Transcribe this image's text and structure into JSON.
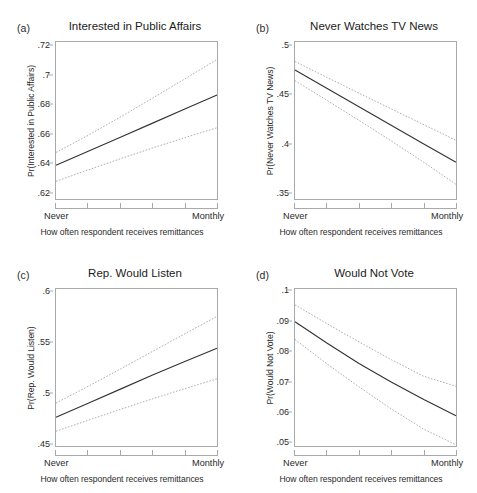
{
  "figure": {
    "xaxis_title": "How often respondent receives remittances",
    "xtick_left": "Never",
    "xtick_right": "Monthly",
    "n_xticks": 6,
    "fit_color": "#333333",
    "ci_color": "#9d9d9d",
    "frame_color": "#a9a9a9"
  },
  "panels": [
    {
      "tag": "(a)",
      "title": "Interested in Public Affairs",
      "ylabel": "Pr(Interested in Public Affairs)",
      "yticks": [
        ".62",
        ".64",
        ".66",
        ".68",
        ".7",
        ".72"
      ],
      "ytick_values": [
        0.62,
        0.64,
        0.66,
        0.68,
        0.7,
        0.72
      ],
      "ylim": [
        0.615,
        0.723
      ],
      "xlim": [
        0,
        1
      ]
    },
    {
      "tag": "(b)",
      "title": "Never Watches TV News",
      "ylabel": "Pr(Never Watches TV News)",
      "yticks": [
        ".35",
        ".4",
        ".45",
        ".5"
      ],
      "ytick_values": [
        0.35,
        0.4,
        0.45,
        0.5
      ],
      "ylim": [
        0.343,
        0.504
      ],
      "xlim": [
        0,
        1
      ]
    },
    {
      "tag": "(c)",
      "title": "Rep. Would Listen",
      "ylabel": "Pr(Rep. Would Listen)",
      "yticks": [
        ".45",
        ".5",
        ".55",
        ".6"
      ],
      "ytick_values": [
        0.45,
        0.5,
        0.55,
        0.6
      ],
      "ylim": [
        0.447,
        0.603
      ],
      "xlim": [
        0,
        1
      ]
    },
    {
      "tag": "(d)",
      "title": "Would Not Vote",
      "ylabel": "Pr(Would Not Vote)",
      "yticks": [
        ".05",
        ".06",
        ".07",
        ".08",
        ".09",
        ".1"
      ],
      "ytick_values": [
        0.05,
        0.06,
        0.07,
        0.08,
        0.09,
        0.1
      ],
      "ylim": [
        0.0485,
        0.1008
      ],
      "xlim": [
        0,
        1
      ]
    }
  ],
  "chart_data": [
    {
      "type": "line",
      "panel": "(a)",
      "title": "Interested in Public Affairs",
      "xlabel": "How often respondent receives remittances",
      "ylabel": "Pr(Interested in Public Affairs)",
      "xtick_labels": [
        "Never",
        "",
        "",
        "",
        "",
        "Monthly"
      ],
      "x": [
        0,
        0.2,
        0.4,
        0.6,
        0.8,
        1
      ],
      "ylim": [
        0.615,
        0.723
      ],
      "grid": false,
      "legend": "none",
      "series": [
        {
          "name": "Predicted probability",
          "style": "solid",
          "values": [
            0.6382,
            0.6478,
            0.6575,
            0.6672,
            0.6769,
            0.6866
          ]
        },
        {
          "name": "95% CI upper",
          "style": "dotted",
          "values": [
            0.647,
            0.6588,
            0.6714,
            0.6844,
            0.6976,
            0.711
          ]
        },
        {
          "name": "95% CI lower",
          "style": "dotted",
          "values": [
            0.6272,
            0.635,
            0.6427,
            0.6501,
            0.6572,
            0.664
          ]
        }
      ]
    },
    {
      "type": "line",
      "panel": "(b)",
      "title": "Never Watches TV News",
      "xlabel": "How often respondent receives remittances",
      "ylabel": "Pr(Never Watches TV News)",
      "xtick_labels": [
        "Never",
        "",
        "",
        "",
        "",
        "Monthly"
      ],
      "x": [
        0,
        0.2,
        0.4,
        0.6,
        0.8,
        1
      ],
      "ylim": [
        0.343,
        0.504
      ],
      "grid": false,
      "legend": "none",
      "series": [
        {
          "name": "Predicted probability",
          "style": "solid",
          "values": [
            0.4752,
            0.4562,
            0.4373,
            0.4184,
            0.3995,
            0.3808
          ]
        },
        {
          "name": "95% CI upper",
          "style": "dotted",
          "values": [
            0.484,
            0.4676,
            0.4513,
            0.4352,
            0.4192,
            0.4032
          ]
        },
        {
          "name": "95% CI lower",
          "style": "dotted",
          "values": [
            0.4643,
            0.444,
            0.4234,
            0.4023,
            0.3807,
            0.358
          ]
        }
      ]
    },
    {
      "type": "line",
      "panel": "(c)",
      "title": "Rep. Would Listen",
      "xlabel": "How often respondent receives remittances",
      "ylabel": "Pr(Rep. Would Listen)",
      "xtick_labels": [
        "Never",
        "",
        "",
        "",
        "",
        "Monthly"
      ],
      "x": [
        0,
        0.2,
        0.4,
        0.6,
        0.8,
        1
      ],
      "ylim": [
        0.447,
        0.603
      ],
      "grid": false,
      "legend": "none",
      "series": [
        {
          "name": "Predicted probability",
          "style": "solid",
          "values": [
            0.4755,
            0.4895,
            0.5035,
            0.5175,
            0.531,
            0.5442
          ]
        },
        {
          "name": "95% CI upper",
          "style": "dotted",
          "values": [
            0.4897,
            0.5063,
            0.5235,
            0.541,
            0.5585,
            0.5758
          ]
        },
        {
          "name": "95% CI lower",
          "style": "dotted",
          "values": [
            0.4617,
            0.4726,
            0.4834,
            0.4939,
            0.504,
            0.5138
          ]
        }
      ]
    },
    {
      "type": "line",
      "panel": "(d)",
      "title": "Would Not Vote",
      "xlabel": "How often respondent receives remittances",
      "ylabel": "Pr(Would Not Vote)",
      "xtick_labels": [
        "Never",
        "",
        "",
        "",
        "",
        "Monthly"
      ],
      "x": [
        0,
        0.2,
        0.4,
        0.6,
        0.8,
        1
      ],
      "ylim": [
        0.0485,
        0.1008
      ],
      "grid": false,
      "legend": "none",
      "series": [
        {
          "name": "Predicted probability",
          "style": "solid",
          "values": [
            0.0899,
            0.0827,
            0.0759,
            0.0697,
            0.064,
            0.0586
          ]
        },
        {
          "name": "95% CI upper",
          "style": "dotted",
          "values": [
            0.0955,
            0.0892,
            0.0831,
            0.0772,
            0.0717,
            0.0684
          ]
        },
        {
          "name": "95% CI lower",
          "style": "dotted",
          "values": [
            0.084,
            0.0758,
            0.0681,
            0.0608,
            0.0541,
            0.0489
          ]
        }
      ]
    }
  ]
}
